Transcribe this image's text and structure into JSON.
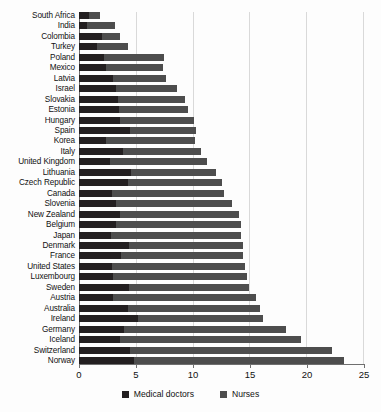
{
  "chart_data": {
    "type": "bar",
    "orientation": "horizontal",
    "stacked": true,
    "title": "",
    "subtitle": "",
    "xlabel": "",
    "ylabel": "",
    "xlim": [
      0,
      25
    ],
    "xticks": [
      0,
      5,
      10,
      15,
      20,
      25
    ],
    "xtick_labels": [
      "0",
      "5",
      "10",
      "15",
      "20",
      "25"
    ],
    "grid": true,
    "grid_axis": "x",
    "legend_position": "bottom-center",
    "legend": [
      "Medical doctors",
      "Nurses"
    ],
    "colors": {
      "doctors": "#231f20",
      "nurses": "#4d4d4d",
      "gridline": "#d9d9d9",
      "axis": "#6f6f6f",
      "background": "#fdfdfd"
    },
    "categories": [
      "South Africa",
      "India",
      "Colombia",
      "Turkey",
      "Poland",
      "Mexico",
      "Latvia",
      "Israel",
      "Slovakia",
      "Estonia",
      "Hungary",
      "Spain",
      "Korea",
      "Italy",
      "United Kingdom",
      "Lithuania",
      "Czech Republic",
      "Canada",
      "Slovenia",
      "New Zealand",
      "Belgium",
      "Japan",
      "Denmark",
      "France",
      "United States",
      "Luxembourg",
      "Sweden",
      "Austria",
      "Australia",
      "Ireland",
      "Germany",
      "Iceland",
      "Switzerland",
      "Norway"
    ],
    "series": [
      {
        "name": "Medical doctors",
        "values": [
          0.9,
          0.7,
          2.0,
          1.6,
          2.2,
          2.4,
          3.0,
          3.3,
          3.4,
          3.5,
          3.6,
          4.5,
          2.4,
          3.9,
          2.7,
          4.6,
          4.3,
          2.9,
          3.3,
          3.6,
          3.3,
          2.8,
          4.4,
          3.7,
          2.9,
          3.0,
          4.4,
          3.0,
          4.3,
          5.2,
          4.0,
          3.6,
          4.5,
          4.8
        ]
      },
      {
        "name": "Nurses",
        "values": [
          0.95,
          2.5,
          1.6,
          2.7,
          5.3,
          5.0,
          4.7,
          5.3,
          5.9,
          6.1,
          6.5,
          5.8,
          7.8,
          6.8,
          8.6,
          7.5,
          8.3,
          9.9,
          10.2,
          10.5,
          11.0,
          11.5,
          10.0,
          10.7,
          11.7,
          11.8,
          10.6,
          12.6,
          11.6,
          11.0,
          14.2,
          15.9,
          17.8,
          18.5
        ]
      }
    ],
    "totals": [
      1.85,
      3.2,
      3.6,
      4.3,
      7.5,
      7.4,
      7.7,
      8.6,
      9.3,
      9.6,
      10.1,
      10.3,
      10.2,
      10.7,
      11.3,
      12.1,
      12.6,
      12.8,
      13.5,
      14.1,
      14.3,
      14.3,
      14.4,
      14.4,
      14.6,
      14.8,
      15.0,
      15.6,
      15.9,
      16.2,
      18.2,
      19.5,
      22.3,
      23.3
    ]
  }
}
